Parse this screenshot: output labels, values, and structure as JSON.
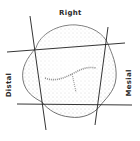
{
  "figure": {
    "type": "tooth outline with reference lines",
    "labels": {
      "top": "Right",
      "left": "Distal",
      "right": "Mesial"
    },
    "colors": {
      "background": "#ffffff",
      "outline": "#3a3a3a",
      "stipple": "#9a9a9a",
      "lines": "#1e1e1e",
      "text": "#2a2a2a"
    },
    "reference_lines": [
      {
        "name": "upper-horizontal",
        "x1": 7,
        "y1": 52,
        "x2": 125,
        "y2": 43
      },
      {
        "name": "lower-horizontal",
        "x1": 17,
        "y1": 104,
        "x2": 132,
        "y2": 105
      },
      {
        "name": "left-vertical",
        "x1": 30,
        "y1": 16,
        "x2": 46,
        "y2": 130
      },
      {
        "name": "right-vertical",
        "x1": 108,
        "y1": 27,
        "x2": 95,
        "y2": 125
      }
    ]
  }
}
